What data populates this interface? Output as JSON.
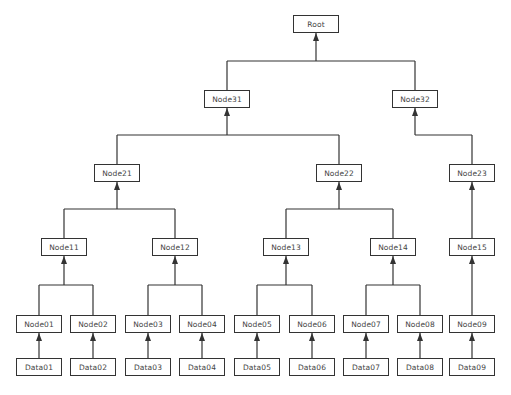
{
  "diagram": {
    "type": "tree",
    "direction": "bottom-up arrows (child to parent)",
    "colors": {
      "line": "#333333",
      "box_border": "#333333",
      "text": "#444444",
      "background": "#ffffff"
    },
    "nodes": [
      {
        "id": "root",
        "label": "Root",
        "x": 293,
        "y": 15
      },
      {
        "id": "node31",
        "label": "Node31",
        "x": 204,
        "y": 90
      },
      {
        "id": "node32",
        "label": "Node32",
        "x": 392,
        "y": 90
      },
      {
        "id": "node21",
        "label": "Node21",
        "x": 94,
        "y": 164
      },
      {
        "id": "node22",
        "label": "Node22",
        "x": 316,
        "y": 164
      },
      {
        "id": "node23",
        "label": "Node23",
        "x": 449,
        "y": 164
      },
      {
        "id": "node11",
        "label": "Node11",
        "x": 41,
        "y": 238
      },
      {
        "id": "node12",
        "label": "Node12",
        "x": 152,
        "y": 238
      },
      {
        "id": "node13",
        "label": "Node13",
        "x": 263,
        "y": 238
      },
      {
        "id": "node14",
        "label": "Node14",
        "x": 370,
        "y": 238
      },
      {
        "id": "node15",
        "label": "Node15",
        "x": 449,
        "y": 238
      },
      {
        "id": "node01",
        "label": "Node01",
        "x": 16,
        "y": 315
      },
      {
        "id": "node02",
        "label": "Node02",
        "x": 70,
        "y": 315
      },
      {
        "id": "node03",
        "label": "Node03",
        "x": 125,
        "y": 315
      },
      {
        "id": "node04",
        "label": "Node04",
        "x": 179,
        "y": 315
      },
      {
        "id": "node05",
        "label": "Node05",
        "x": 234,
        "y": 315
      },
      {
        "id": "node06",
        "label": "Node06",
        "x": 289,
        "y": 315
      },
      {
        "id": "node07",
        "label": "Node07",
        "x": 343,
        "y": 315
      },
      {
        "id": "node08",
        "label": "Node08",
        "x": 397,
        "y": 315
      },
      {
        "id": "node09",
        "label": "Node09",
        "x": 449,
        "y": 315
      },
      {
        "id": "data01",
        "label": "Data01",
        "x": 16,
        "y": 358
      },
      {
        "id": "data02",
        "label": "Data02",
        "x": 70,
        "y": 358
      },
      {
        "id": "data03",
        "label": "Data03",
        "x": 125,
        "y": 358
      },
      {
        "id": "data04",
        "label": "Data04",
        "x": 179,
        "y": 358
      },
      {
        "id": "data05",
        "label": "Data05",
        "x": 234,
        "y": 358
      },
      {
        "id": "data06",
        "label": "Data06",
        "x": 289,
        "y": 358
      },
      {
        "id": "data07",
        "label": "Data07",
        "x": 343,
        "y": 358
      },
      {
        "id": "data08",
        "label": "Data08",
        "x": 397,
        "y": 358
      },
      {
        "id": "data09",
        "label": "Data09",
        "x": 449,
        "y": 358
      }
    ],
    "groups": [
      {
        "parent": "root",
        "children": [
          "node31",
          "node32"
        ]
      },
      {
        "parent": "node31",
        "children": [
          "node21",
          "node22"
        ]
      },
      {
        "parent": "node32",
        "children": [
          "node23"
        ]
      },
      {
        "parent": "node21",
        "children": [
          "node11",
          "node12"
        ]
      },
      {
        "parent": "node22",
        "children": [
          "node13",
          "node14"
        ]
      },
      {
        "parent": "node23",
        "children": [
          "node15"
        ]
      },
      {
        "parent": "node11",
        "children": [
          "node01",
          "node02"
        ]
      },
      {
        "parent": "node12",
        "children": [
          "node03",
          "node04"
        ]
      },
      {
        "parent": "node13",
        "children": [
          "node05",
          "node06"
        ]
      },
      {
        "parent": "node14",
        "children": [
          "node07",
          "node08"
        ]
      },
      {
        "parent": "node15",
        "children": [
          "node09"
        ]
      },
      {
        "parent": "node01",
        "children": [
          "data01"
        ]
      },
      {
        "parent": "node02",
        "children": [
          "data02"
        ]
      },
      {
        "parent": "node03",
        "children": [
          "data03"
        ]
      },
      {
        "parent": "node04",
        "children": [
          "data04"
        ]
      },
      {
        "parent": "node05",
        "children": [
          "data05"
        ]
      },
      {
        "parent": "node06",
        "children": [
          "data06"
        ]
      },
      {
        "parent": "node07",
        "children": [
          "data07"
        ]
      },
      {
        "parent": "node08",
        "children": [
          "data08"
        ]
      },
      {
        "parent": "node09",
        "children": [
          "data09"
        ]
      }
    ]
  },
  "caption": {
    "text": ""
  }
}
